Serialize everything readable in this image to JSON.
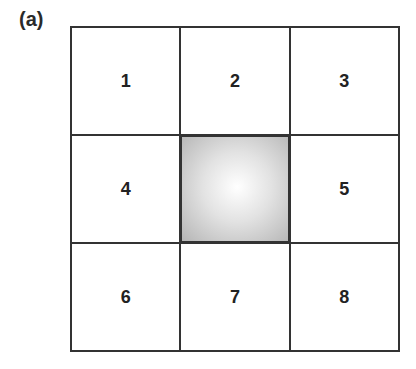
{
  "panel_label": "(a)",
  "grid": {
    "rows": 3,
    "cols": 3,
    "cells": [
      "1",
      "2",
      "3",
      "4",
      "",
      "5",
      "6",
      "7",
      "8"
    ],
    "center_cell": {
      "style": "radial gradient, white center fading to gray",
      "colors": [
        "#ffffff",
        "#b5b5b5"
      ]
    }
  }
}
